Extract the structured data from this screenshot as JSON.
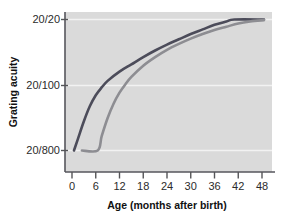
{
  "chart_data": {
    "type": "line",
    "title": "",
    "xlabel": "Age (months after birth)",
    "ylabel": "Grating acuity",
    "xlim": [
      -2,
      50
    ],
    "ylim_labels": [
      "20/800",
      "20/100",
      "20/20"
    ],
    "xticks": [
      0,
      6,
      12,
      18,
      24,
      30,
      36,
      42,
      48
    ],
    "xticklabels": [
      "0",
      "6",
      "12",
      "18",
      "24",
      "30",
      "36",
      "42",
      "48"
    ],
    "yticks": [
      0,
      1,
      2
    ],
    "yticklabels": [
      "20/800",
      "20/100",
      "20/20"
    ],
    "grid": "horizontal-white-gridlines",
    "legend": "none",
    "series": [
      {
        "name": "upper-curve",
        "color": "#4c4c5a",
        "points": [
          {
            "x": 0.5,
            "y": 0.0
          },
          {
            "x": 1.5,
            "y": 0.18
          },
          {
            "x": 3.0,
            "y": 0.45
          },
          {
            "x": 4.5,
            "y": 0.68
          },
          {
            "x": 6.0,
            "y": 0.85
          },
          {
            "x": 7.5,
            "y": 0.97
          },
          {
            "x": 9.0,
            "y": 1.07
          },
          {
            "x": 12.0,
            "y": 1.21
          },
          {
            "x": 15.0,
            "y": 1.32
          },
          {
            "x": 18.0,
            "y": 1.43
          },
          {
            "x": 21.0,
            "y": 1.53
          },
          {
            "x": 24.0,
            "y": 1.62
          },
          {
            "x": 27.0,
            "y": 1.7
          },
          {
            "x": 30.0,
            "y": 1.78
          },
          {
            "x": 33.0,
            "y": 1.85
          },
          {
            "x": 36.0,
            "y": 1.92
          },
          {
            "x": 39.0,
            "y": 1.97
          },
          {
            "x": 41.0,
            "y": 2.0
          },
          {
            "x": 48.5,
            "y": 2.0
          }
        ]
      },
      {
        "name": "lower-curve",
        "color": "#8d8d92",
        "points": [
          {
            "x": 2.5,
            "y": 0.0
          },
          {
            "x": 6.5,
            "y": 0.0
          },
          {
            "x": 7.5,
            "y": 0.22
          },
          {
            "x": 9.0,
            "y": 0.5
          },
          {
            "x": 10.5,
            "y": 0.72
          },
          {
            "x": 12.0,
            "y": 0.89
          },
          {
            "x": 13.5,
            "y": 1.02
          },
          {
            "x": 15.0,
            "y": 1.13
          },
          {
            "x": 18.0,
            "y": 1.3
          },
          {
            "x": 21.0,
            "y": 1.43
          },
          {
            "x": 24.0,
            "y": 1.54
          },
          {
            "x": 27.0,
            "y": 1.63
          },
          {
            "x": 30.0,
            "y": 1.71
          },
          {
            "x": 33.0,
            "y": 1.78
          },
          {
            "x": 36.0,
            "y": 1.84
          },
          {
            "x": 39.0,
            "y": 1.89
          },
          {
            "x": 42.0,
            "y": 1.94
          },
          {
            "x": 45.0,
            "y": 1.97
          },
          {
            "x": 48.5,
            "y": 1.99
          }
        ]
      }
    ],
    "colors": {
      "plot_background": "#dadada",
      "gridline": "#f2f2f2",
      "axis": "#555558",
      "text": "#1a1a1a"
    }
  },
  "axes": {
    "y_label": "Grating acuity",
    "x_label": "Age (months after birth)",
    "y_ticks": [
      {
        "label": "20/20"
      },
      {
        "label": "20/100"
      },
      {
        "label": "20/800"
      }
    ],
    "x_ticks": [
      {
        "label": "0"
      },
      {
        "label": "6"
      },
      {
        "label": "12"
      },
      {
        "label": "18"
      },
      {
        "label": "24"
      },
      {
        "label": "30"
      },
      {
        "label": "36"
      },
      {
        "label": "42"
      },
      {
        "label": "48"
      }
    ]
  }
}
